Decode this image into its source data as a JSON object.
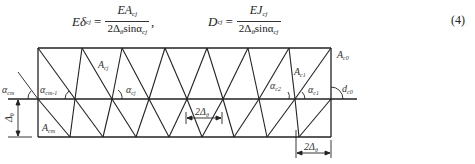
{
  "equations": {
    "left": {
      "lhs_main": "Eδ",
      "lhs_sub": "cj",
      "eq": "=",
      "num_main": "EA",
      "num_sub": "cj",
      "den_main": "2Δ",
      "den_sub1": "θ",
      "den_sin": "sinα",
      "den_sub2": "cj",
      "trail": ","
    },
    "right": {
      "lhs_main": "D",
      "lhs_sub": "cj",
      "eq": "=",
      "num_main": "EJ",
      "num_sub": "cj",
      "den_main": "2Δ",
      "den_sub1": "θ",
      "den_sin": "sinα",
      "den_sub2": "cj"
    },
    "number": "(4)"
  },
  "diagram": {
    "labels": {
      "A_cj": {
        "main": "A",
        "sub": "cj"
      },
      "A_cm": {
        "main": "A",
        "sub": "cm"
      },
      "A_c1": {
        "main": "A",
        "sub": "c1"
      },
      "A_c0": {
        "main": "A",
        "sub": "c0"
      },
      "alpha_cm": {
        "main": "α",
        "sub": "cm"
      },
      "alpha_cm1": {
        "main": "α",
        "sub": "cm-1"
      },
      "alpha_cj": {
        "main": "α",
        "sub": "cj"
      },
      "alpha_c2": {
        "main": "α",
        "sub": "c2"
      },
      "alpha_c1": {
        "main": "α",
        "sub": "c1"
      },
      "d_c0": {
        "main": "d",
        "sub": "c0"
      },
      "delta_theta": {
        "main": "Δ",
        "sub": "θ"
      },
      "dim_mid": {
        "main": "2Δ",
        "sub": "θ"
      },
      "dim_right": {
        "main": "2Δ",
        "sub": "θ"
      }
    },
    "stroke_color": "#222222"
  }
}
